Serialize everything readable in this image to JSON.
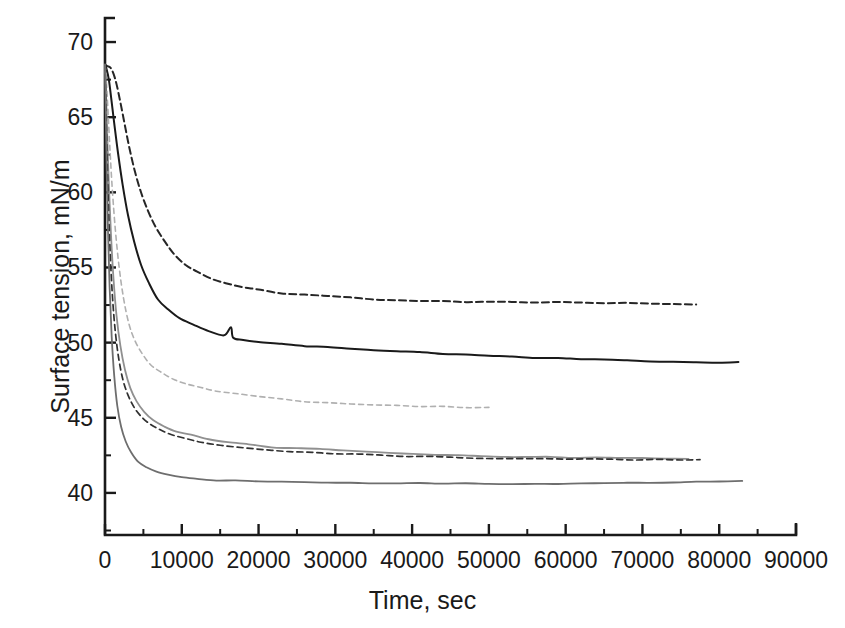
{
  "chart_data": {
    "type": "line",
    "title": "",
    "xlabel": "Time, sec",
    "ylabel": "Surface tension, mN/m",
    "xlim": [
      0,
      90000
    ],
    "ylim": [
      37.2,
      71.6
    ],
    "grid": false,
    "legend": "none",
    "xticks": [
      0,
      10000,
      20000,
      30000,
      40000,
      50000,
      60000,
      70000,
      80000,
      90000
    ],
    "xtick_labels": [
      "0",
      "10000",
      "20000",
      "30000",
      "40000",
      "50000",
      "60000",
      "70000",
      "80000",
      "90000"
    ],
    "xminor_step": 5000,
    "yticks": [
      40,
      45,
      50,
      55,
      60,
      65,
      70
    ],
    "ytick_labels": [
      "40",
      "45",
      "50",
      "55",
      "60",
      "65",
      "70"
    ],
    "yminor_step": 2.5,
    "series": [
      {
        "name": "curve-1-dark-dashed-top",
        "style": "dashed",
        "color": "#262626",
        "width": 2.0,
        "dash": "7,4",
        "points": [
          [
            0,
            68.5
          ],
          [
            300,
            68.4
          ],
          [
            700,
            68.3
          ],
          [
            1100,
            67.9
          ],
          [
            1500,
            67.2
          ],
          [
            2000,
            66.0
          ],
          [
            2600,
            64.4
          ],
          [
            3200,
            62.9
          ],
          [
            3900,
            61.4
          ],
          [
            4700,
            60.0
          ],
          [
            5600,
            58.8
          ],
          [
            6600,
            57.7
          ],
          [
            7800,
            56.7
          ],
          [
            9000,
            55.9
          ],
          [
            10500,
            55.2
          ],
          [
            12000,
            54.7
          ],
          [
            14000,
            54.2
          ],
          [
            16000,
            53.9
          ],
          [
            18000,
            53.7
          ],
          [
            20000,
            53.5
          ],
          [
            23000,
            53.3
          ],
          [
            26000,
            53.2
          ],
          [
            29000,
            53.1
          ],
          [
            32000,
            53.0
          ],
          [
            35000,
            52.9
          ],
          [
            38000,
            52.85
          ],
          [
            41000,
            52.8
          ],
          [
            44000,
            52.75
          ],
          [
            47000,
            52.72
          ],
          [
            50000,
            52.7
          ],
          [
            53000,
            52.68
          ],
          [
            56000,
            52.68
          ],
          [
            59000,
            52.7
          ],
          [
            62000,
            52.68
          ],
          [
            65000,
            52.65
          ],
          [
            68000,
            52.62
          ],
          [
            71000,
            52.6
          ],
          [
            74000,
            52.58
          ],
          [
            77000,
            52.55
          ]
        ]
      },
      {
        "name": "curve-2-dark-solid",
        "style": "solid",
        "color": "#1a1a1a",
        "width": 2.0,
        "dash": "",
        "points": [
          [
            0,
            68.5
          ],
          [
            200,
            68.2
          ],
          [
            500,
            67.5
          ],
          [
            800,
            66.3
          ],
          [
            1200,
            64.6
          ],
          [
            1700,
            62.6
          ],
          [
            2300,
            60.5
          ],
          [
            3000,
            58.5
          ],
          [
            3800,
            56.7
          ],
          [
            4700,
            55.2
          ],
          [
            5700,
            54.0
          ],
          [
            6900,
            52.9
          ],
          [
            8200,
            52.2
          ],
          [
            9700,
            51.6
          ],
          [
            11500,
            51.2
          ],
          [
            13500,
            50.8
          ],
          [
            15500,
            50.5
          ],
          [
            16400,
            51.0
          ],
          [
            16700,
            50.35
          ],
          [
            18000,
            50.2
          ],
          [
            20000,
            50.05
          ],
          [
            23000,
            49.9
          ],
          [
            26000,
            49.8
          ],
          [
            29000,
            49.7
          ],
          [
            32000,
            49.6
          ],
          [
            35000,
            49.5
          ],
          [
            38000,
            49.42
          ],
          [
            41000,
            49.35
          ],
          [
            44000,
            49.27
          ],
          [
            47000,
            49.2
          ],
          [
            50000,
            49.13
          ],
          [
            53000,
            49.06
          ],
          [
            56000,
            49.0
          ],
          [
            59000,
            48.95
          ],
          [
            62000,
            48.9
          ],
          [
            65000,
            48.85
          ],
          [
            68000,
            48.8
          ],
          [
            71000,
            48.76
          ],
          [
            74000,
            48.72
          ],
          [
            77000,
            48.68
          ],
          [
            80000,
            48.66
          ],
          [
            82500,
            48.7
          ]
        ]
      },
      {
        "name": "curve-3-light-dashed",
        "style": "dashed",
        "color": "#b0b0b0",
        "width": 1.6,
        "dash": "5,4",
        "points": [
          [
            0,
            68.5
          ],
          [
            150,
            67.6
          ],
          [
            350,
            65.8
          ],
          [
            600,
            63.3
          ],
          [
            900,
            60.6
          ],
          [
            1300,
            57.8
          ],
          [
            1800,
            55.2
          ],
          [
            2400,
            53.0
          ],
          [
            3100,
            51.3
          ],
          [
            3900,
            50.1
          ],
          [
            4900,
            49.2
          ],
          [
            6000,
            48.5
          ],
          [
            7300,
            48.0
          ],
          [
            8800,
            47.6
          ],
          [
            10500,
            47.3
          ],
          [
            12500,
            47.0
          ],
          [
            14500,
            46.8
          ],
          [
            17000,
            46.6
          ],
          [
            20000,
            46.4
          ],
          [
            23000,
            46.25
          ],
          [
            26000,
            46.1
          ],
          [
            29000,
            46.0
          ],
          [
            32000,
            45.92
          ],
          [
            35000,
            45.85
          ],
          [
            38000,
            45.8
          ],
          [
            41000,
            45.76
          ],
          [
            44000,
            45.73
          ],
          [
            47000,
            45.7
          ],
          [
            50000,
            45.68
          ]
        ]
      },
      {
        "name": "curve-4-gray-solid",
        "style": "solid",
        "color": "#909090",
        "width": 1.8,
        "dash": "",
        "points": [
          [
            0,
            68.5
          ],
          [
            120,
            66.8
          ],
          [
            280,
            64.0
          ],
          [
            500,
            60.6
          ],
          [
            780,
            57.2
          ],
          [
            1100,
            54.3
          ],
          [
            1500,
            51.8
          ],
          [
            2000,
            49.8
          ],
          [
            2600,
            48.2
          ],
          [
            3300,
            47.0
          ],
          [
            4100,
            46.1
          ],
          [
            5100,
            45.4
          ],
          [
            6300,
            44.8
          ],
          [
            7700,
            44.4
          ],
          [
            9300,
            44.1
          ],
          [
            11200,
            43.85
          ],
          [
            13500,
            43.6
          ],
          [
            16000,
            43.4
          ],
          [
            19000,
            43.2
          ],
          [
            22000,
            43.05
          ],
          [
            25000,
            42.95
          ],
          [
            28000,
            42.9
          ],
          [
            31000,
            42.85
          ],
          [
            34000,
            42.78
          ],
          [
            37000,
            42.7
          ],
          [
            40000,
            42.62
          ],
          [
            43000,
            42.55
          ],
          [
            46000,
            42.5
          ],
          [
            49000,
            42.45
          ],
          [
            52000,
            42.42
          ],
          [
            55000,
            42.4
          ],
          [
            58000,
            42.38
          ],
          [
            61000,
            42.36
          ],
          [
            64000,
            42.34
          ],
          [
            67000,
            42.32
          ],
          [
            70000,
            42.3
          ],
          [
            73000,
            42.28
          ],
          [
            76000,
            42.25
          ]
        ]
      },
      {
        "name": "curve-5-dark-dashed-lower",
        "style": "dashed",
        "color": "#303030",
        "width": 1.7,
        "dash": "6,4",
        "points": [
          [
            0,
            68.5
          ],
          [
            100,
            66.2
          ],
          [
            240,
            63.0
          ],
          [
            430,
            59.4
          ],
          [
            680,
            55.9
          ],
          [
            980,
            53.0
          ],
          [
            1350,
            50.7
          ],
          [
            1800,
            48.9
          ],
          [
            2350,
            47.5
          ],
          [
            3000,
            46.5
          ],
          [
            3800,
            45.7
          ],
          [
            4700,
            45.1
          ],
          [
            5800,
            44.6
          ],
          [
            7100,
            44.2
          ],
          [
            8600,
            43.9
          ],
          [
            10400,
            43.65
          ],
          [
            12500,
            43.4
          ],
          [
            15000,
            43.2
          ],
          [
            18000,
            43.0
          ],
          [
            21000,
            42.85
          ],
          [
            24000,
            42.75
          ],
          [
            27000,
            42.68
          ],
          [
            30000,
            42.62
          ],
          [
            33000,
            42.56
          ],
          [
            36000,
            42.5
          ],
          [
            39000,
            42.45
          ],
          [
            42000,
            42.4
          ],
          [
            45000,
            42.36
          ],
          [
            48000,
            42.33
          ],
          [
            51000,
            42.3
          ],
          [
            54000,
            42.28
          ],
          [
            57000,
            42.26
          ],
          [
            60000,
            42.25
          ],
          [
            63000,
            42.24
          ],
          [
            66000,
            42.23
          ],
          [
            69000,
            42.22
          ],
          [
            72000,
            42.2
          ],
          [
            75000,
            42.2
          ],
          [
            77500,
            42.2
          ]
        ]
      },
      {
        "name": "curve-6-gray-solid-bottom",
        "style": "solid",
        "color": "#6e6e6e",
        "width": 1.8,
        "dash": "",
        "points": [
          [
            0,
            68.5
          ],
          [
            90,
            65.6
          ],
          [
            210,
            61.8
          ],
          [
            380,
            57.6
          ],
          [
            600,
            53.7
          ],
          [
            870,
            50.4
          ],
          [
            1200,
            47.8
          ],
          [
            1600,
            45.8
          ],
          [
            2100,
            44.4
          ],
          [
            2700,
            43.4
          ],
          [
            3400,
            42.7
          ],
          [
            4300,
            42.1
          ],
          [
            5400,
            41.7
          ],
          [
            6700,
            41.4
          ],
          [
            8200,
            41.2
          ],
          [
            10000,
            41.05
          ],
          [
            12000,
            40.95
          ],
          [
            14500,
            40.85
          ],
          [
            17000,
            40.8
          ],
          [
            20000,
            40.75
          ],
          [
            23000,
            40.72
          ],
          [
            26000,
            40.7
          ],
          [
            29000,
            40.68
          ],
          [
            32000,
            40.67
          ],
          [
            35000,
            40.66
          ],
          [
            38000,
            40.65
          ],
          [
            41000,
            40.64
          ],
          [
            44000,
            40.64
          ],
          [
            47000,
            40.63
          ],
          [
            50000,
            40.63
          ],
          [
            53000,
            40.62
          ],
          [
            56000,
            40.62
          ],
          [
            59000,
            40.62
          ],
          [
            62000,
            40.63
          ],
          [
            65000,
            40.65
          ],
          [
            68000,
            40.68
          ],
          [
            71000,
            40.7
          ],
          [
            74000,
            40.72
          ],
          [
            77000,
            40.74
          ],
          [
            80000,
            40.76
          ],
          [
            83000,
            40.78
          ]
        ]
      }
    ]
  },
  "axes": {
    "left_px": 105,
    "right_px": 796,
    "top_px": 18,
    "bottom_px": 535,
    "frame_color": "#1a1a1a"
  }
}
